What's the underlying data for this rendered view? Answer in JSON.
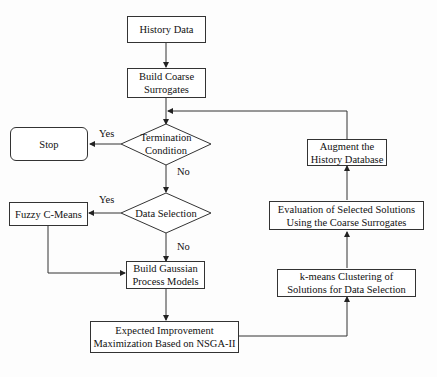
{
  "diagram": {
    "type": "flowchart",
    "nodes": {
      "history_data": "History Data",
      "build_coarse": "Build Coarse Surrogates",
      "termination": "Termination Condition",
      "stop": "Stop",
      "data_selection": "Data Selection",
      "fuzzy": "Fuzzy C-Means",
      "build_gp": "Build Gaussian Process Models",
      "ei_max": "Expected Improvement Maximization Based on NSGA-II",
      "kmeans": "k-means Clustering of Solutions for Data Selection",
      "evaluation": "Evaluation of Selected Solutions Using the Coarse Surrogates",
      "augment": "Augment the History Database"
    },
    "node_lines": {
      "build_coarse": [
        "Build Coarse",
        "Surrogates"
      ],
      "termination": [
        "Termination",
        "Condition"
      ],
      "build_gp": [
        "Build Gaussian",
        "Process Models"
      ],
      "ei_max": [
        "Expected Improvement",
        "Maximization Based on NSGA-II"
      ],
      "kmeans": [
        "k-means Clustering of",
        "Solutions for Data Selection"
      ],
      "evaluation": [
        "Evaluation of Selected Solutions",
        "Using the Coarse Surrogates"
      ],
      "augment": [
        "Augment the",
        "History Database"
      ]
    },
    "edge_labels": {
      "term_yes": "Yes",
      "term_no": "No",
      "sel_yes": "Yes",
      "sel_no": "No"
    },
    "edges": [
      [
        "History Data",
        "Build Coarse Surrogates"
      ],
      [
        "Build Coarse Surrogates",
        "Termination Condition"
      ],
      [
        "Termination Condition",
        "Stop",
        "Yes"
      ],
      [
        "Termination Condition",
        "Data Selection",
        "No"
      ],
      [
        "Data Selection",
        "Fuzzy C-Means",
        "Yes"
      ],
      [
        "Data Selection",
        "Build Gaussian Process Models",
        "No"
      ],
      [
        "Fuzzy C-Means",
        "Build Gaussian Process Models"
      ],
      [
        "Build Gaussian Process Models",
        "Expected Improvement Maximization Based on NSGA-II"
      ],
      [
        "Expected Improvement Maximization Based on NSGA-II",
        "k-means Clustering of Solutions for Data Selection"
      ],
      [
        "k-means Clustering of Solutions for Data Selection",
        "Evaluation of Selected Solutions Using the Coarse Surrogates"
      ],
      [
        "Evaluation of Selected Solutions Using the Coarse Surrogates",
        "Augment the History Database"
      ],
      [
        "Augment the History Database",
        "Termination Condition"
      ]
    ]
  }
}
